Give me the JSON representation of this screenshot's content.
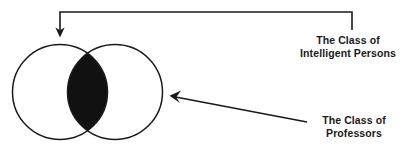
{
  "figure": {
    "type": "venn-diagram",
    "background_color": "#ffffff",
    "stroke_color": "#1a1a1a",
    "fill_color": "#111111"
  },
  "shapes": {
    "left_circle": {
      "name": "left-circle",
      "cx": 60,
      "cy": 92,
      "r": 47.5
    },
    "right_circle": {
      "name": "right-circle",
      "cx": 115,
      "cy": 92,
      "r": 47.5
    },
    "intersection": {
      "name": "intersection-lens",
      "filled": true,
      "fill_color": "#111111"
    }
  },
  "connectors": {
    "top_elbow_arrow": {
      "name": "elbow-arrow-to-circles",
      "start_x": 352,
      "start_y": 30,
      "corner_x": 352,
      "corner_y": 12,
      "bend_x": 60,
      "bend_y": 12,
      "tip_x": 60,
      "tip_y": 37
    },
    "diagonal_arrow": {
      "name": "diagonal-arrow-to-right-circle",
      "start_x": 307,
      "start_y": 122,
      "tip_x": 170,
      "tip_y": 96
    }
  },
  "labels": {
    "intelligent_persons": {
      "line1": "The Class of",
      "line2": "Intelligent Persons"
    },
    "professors": {
      "line1": "The Class of",
      "line2": "Professors"
    }
  }
}
